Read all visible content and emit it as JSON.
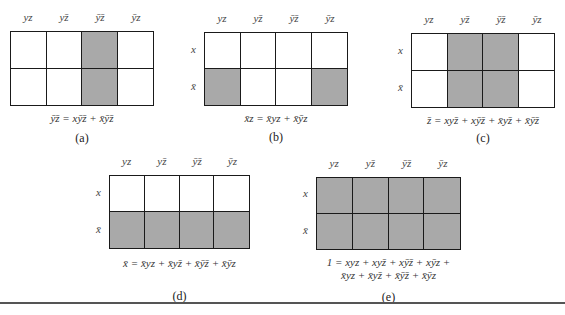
{
  "column_labels": [
    "yz",
    "yz̄",
    "ȳz̄",
    "ȳz"
  ],
  "row_labels": [
    "x",
    "x̄"
  ],
  "colors": {
    "shaded": "#a9a9a9",
    "grid_line": "#1a1a1a",
    "background": "#ffffff"
  },
  "maps": [
    {
      "id": "a",
      "caption": "(a)",
      "show_row_labels": false,
      "shaded": [
        [
          0,
          0,
          1,
          0
        ],
        [
          0,
          0,
          1,
          0
        ]
      ],
      "equation_lines": [
        "ȳz̄ = xȳz̄ + x̄ȳz̄"
      ]
    },
    {
      "id": "b",
      "caption": "(b)",
      "show_row_labels": true,
      "shaded": [
        [
          0,
          0,
          0,
          0
        ],
        [
          1,
          0,
          0,
          1
        ]
      ],
      "equation_lines": [
        "x̄z = x̄yz + x̄ȳz"
      ]
    },
    {
      "id": "c",
      "caption": "(c)",
      "show_row_labels": true,
      "shaded": [
        [
          0,
          1,
          1,
          0
        ],
        [
          0,
          1,
          1,
          0
        ]
      ],
      "equation_lines": [
        "z̄ = xyz̄ + xȳz̄ + x̄yz̄ + x̄ȳz̄"
      ]
    },
    {
      "id": "d",
      "caption": "(d)",
      "show_row_labels": true,
      "shaded": [
        [
          0,
          0,
          0,
          0
        ],
        [
          1,
          1,
          1,
          1
        ]
      ],
      "equation_lines": [
        "x̄ = x̄yz + x̄yz̄ + x̄ȳz̄ + x̄ȳz"
      ]
    },
    {
      "id": "e",
      "caption": "(e)",
      "show_row_labels": true,
      "shaded": [
        [
          1,
          1,
          1,
          1
        ],
        [
          1,
          1,
          1,
          1
        ]
      ],
      "equation_lines": [
        "1 = xyz + xyz̄ + xȳz̄ + xȳz +",
        "x̄yz + x̄yz̄ + x̄ȳz̄ + x̄ȳz"
      ]
    }
  ]
}
